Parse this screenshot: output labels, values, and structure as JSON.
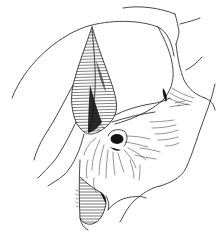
{
  "figure": {
    "type": "anatomical line illustration",
    "colors": {
      "background": "#ffffff",
      "ink": "#1a1a1a"
    }
  }
}
